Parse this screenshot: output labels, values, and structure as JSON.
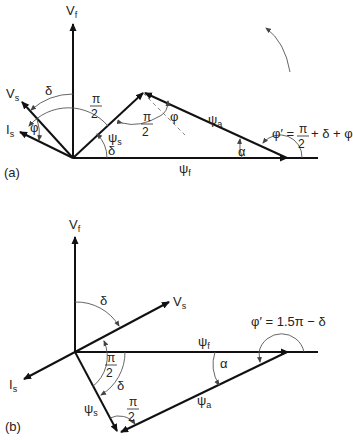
{
  "figure": {
    "panels": [
      {
        "id": "a",
        "label": "(a)",
        "vectors": {
          "Vf": "V",
          "Vf_sub": "f",
          "Vs": "V",
          "Vs_sub": "s",
          "Is": "I",
          "Is_sub": "s",
          "psi_s": "ψ",
          "psi_s_sub": "s",
          "psi_a": "ψ",
          "psi_a_sub": "a",
          "psi_f": "ψ",
          "psi_f_sub": "f"
        },
        "angles": {
          "delta_top": "δ",
          "delta_bottom": "δ",
          "phi_left": "φ",
          "phi_right": "φ",
          "alpha": "α",
          "half_pi_1_num": "π",
          "half_pi_1_den": "2",
          "half_pi_2_num": "π",
          "half_pi_2_den": "2"
        },
        "equation": {
          "lhs": "φ′ =",
          "num": "π",
          "den": "2",
          "rhs": "+ δ + φ"
        }
      },
      {
        "id": "b",
        "label": "(b)",
        "vectors": {
          "Vf": "V",
          "Vf_sub": "f",
          "Vs": "V",
          "Vs_sub": "s",
          "Is": "I",
          "Is_sub": "s",
          "psi_s": "ψ",
          "psi_s_sub": "s",
          "psi_a": "ψ",
          "psi_a_sub": "a",
          "psi_f": "ψ",
          "psi_f_sub": "f"
        },
        "angles": {
          "delta_top": "δ",
          "delta_bottom": "δ",
          "alpha": "α",
          "half_pi_1_num": "π",
          "half_pi_1_den": "2",
          "half_pi_2_num": "π",
          "half_pi_2_den": "2"
        },
        "equation": {
          "text": "φ′ = 1.5π − δ"
        }
      }
    ]
  }
}
